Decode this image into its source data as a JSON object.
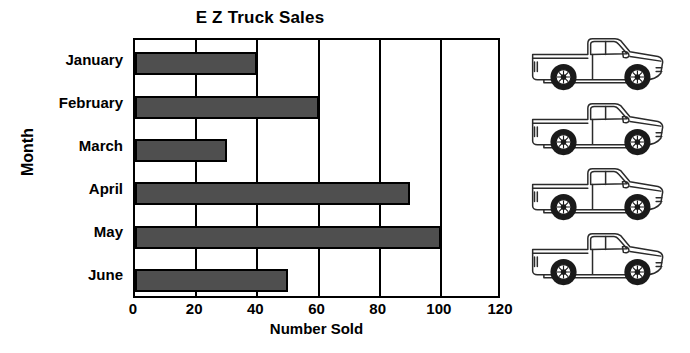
{
  "chart_data": {
    "type": "bar",
    "orientation": "horizontal",
    "title": "E Z Truck Sales",
    "xlabel": "Number Sold",
    "ylabel": "Month",
    "categories": [
      "January",
      "February",
      "March",
      "April",
      "May",
      "June"
    ],
    "values": [
      40,
      60,
      30,
      90,
      100,
      50
    ],
    "xlim": [
      0,
      120
    ],
    "xticks": [
      0,
      20,
      40,
      60,
      80,
      100,
      120
    ],
    "xtick_labels": [
      "0",
      "20",
      "40",
      "60",
      "80",
      "100",
      "120"
    ],
    "grid": "vertical",
    "legend": "none",
    "bar_color": "#4f4f4f",
    "bar_border_color": "#000000",
    "plot_background": "#ffffff",
    "series": [
      {
        "name": "Number Sold",
        "values": [
          40,
          60,
          30,
          90,
          100,
          50
        ]
      }
    ],
    "annotations": {
      "decorations": "four pickup truck line-art illustrations stacked at right of plot"
    }
  },
  "decor": {
    "truck_icon_name": "pickup-truck-icon",
    "truck_count": 4
  }
}
